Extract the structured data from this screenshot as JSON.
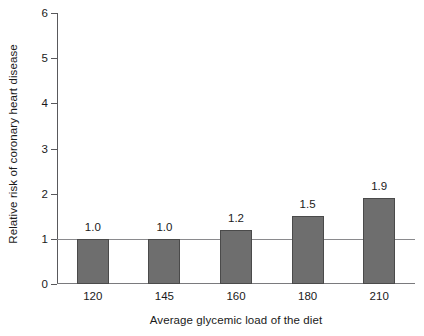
{
  "chart_data": {
    "type": "bar",
    "title": "",
    "xlabel": "Average glycemic load of the diet",
    "ylabel": "Relative risk of coronary heart disease",
    "categories": [
      "120",
      "145",
      "160",
      "180",
      "210"
    ],
    "values": [
      1.0,
      1.0,
      1.2,
      1.5,
      1.9
    ],
    "data_labels": [
      "1.0",
      "1.0",
      "1.2",
      "1.5",
      "1.9"
    ],
    "ylim": [
      0,
      6
    ],
    "yticks": [
      "0",
      "1",
      "2",
      "3",
      "4",
      "5",
      "6"
    ],
    "ytick_values": [
      0,
      1,
      2,
      3,
      4,
      5,
      6
    ],
    "grid": false,
    "legend": "none",
    "reference_line": 1,
    "bar_color": "#6e6e6e",
    "bar_edge_color": "#4a4a4a",
    "axis_color": "#59595c",
    "reference_line_color": "#8a8a8d",
    "background": "#ffffff"
  }
}
